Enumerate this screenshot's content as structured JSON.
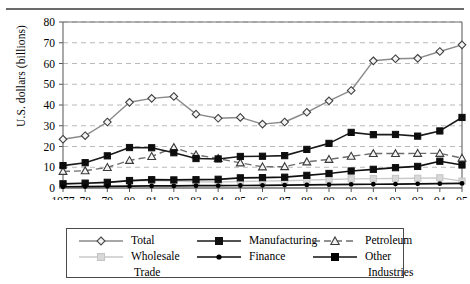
{
  "chart_data": {
    "type": "line",
    "title": "",
    "xlabel": "",
    "ylabel": "U.S. dollars (billions)",
    "ylim": [
      0,
      80
    ],
    "ytick_values": [
      0,
      10,
      20,
      30,
      40,
      50,
      60,
      70,
      80
    ],
    "ytick_labels": [
      "0",
      "10",
      "20",
      "30",
      "40",
      "50",
      "60",
      "70",
      "80"
    ],
    "grid": true,
    "grid_axis": "y",
    "legend_position": "bottom",
    "categories": [
      "1977",
      "78",
      "79",
      "80",
      "81",
      "82",
      "83",
      "84",
      "85",
      "86",
      "87",
      "88",
      "89",
      "90",
      "91",
      "92",
      "93",
      "94",
      "95"
    ],
    "x": [
      1977,
      1978,
      1979,
      1980,
      1981,
      1982,
      1983,
      1984,
      1985,
      1986,
      1987,
      1988,
      1989,
      1990,
      1991,
      1992,
      1993,
      1994,
      1995
    ],
    "series": [
      {
        "name": "Total",
        "marker": "diamond",
        "color": "#8a8a8a",
        "values": [
          23.5,
          25.2,
          31.8,
          41.3,
          43.2,
          44.1,
          35.6,
          33.6,
          34.0,
          30.8,
          31.8,
          36.5,
          42.0,
          47.0,
          61.3,
          62.3,
          62.5,
          65.8,
          69.0
        ]
      },
      {
        "name": "Manufacturing",
        "marker": "square",
        "color": "#1a1a1a",
        "values": [
          10.8,
          12.2,
          15.5,
          19.5,
          19.4,
          17.0,
          14.2,
          14.0,
          15.2,
          15.3,
          15.6,
          18.6,
          21.5,
          26.8,
          25.7,
          25.8,
          25.0,
          27.5,
          34.0
        ]
      },
      {
        "name": "Petroleum",
        "marker": "triangle",
        "color": "#6e6e6e",
        "values": [
          8.0,
          8.3,
          9.9,
          13.3,
          15.2,
          19.5,
          16.0,
          14.2,
          12.1,
          10.2,
          10.3,
          12.6,
          13.8,
          15.3,
          16.6,
          16.6,
          16.7,
          16.7,
          14.4
        ]
      },
      {
        "name": "Wholesale Trade",
        "marker": "square",
        "color": "#c9c9c9",
        "values": [
          2.1,
          2.4,
          2.8,
          3.3,
          3.6,
          3.3,
          3.0,
          2.9,
          3.1,
          3.3,
          3.5,
          3.8,
          4.1,
          4.4,
          4.5,
          4.6,
          4.7,
          4.9,
          3.3
        ]
      },
      {
        "name": "Finance",
        "marker": "dot",
        "color": "#0d0d0d",
        "values": [
          0.6,
          0.7,
          0.8,
          0.9,
          1.0,
          1.0,
          1.1,
          1.1,
          1.2,
          1.3,
          1.4,
          1.5,
          1.6,
          1.7,
          1.8,
          1.9,
          2.0,
          2.1,
          2.2
        ]
      },
      {
        "name": "Other Industries",
        "marker": "square",
        "color": "#111111",
        "values": [
          2.0,
          2.3,
          2.7,
          3.6,
          4.0,
          3.9,
          4.0,
          4.2,
          4.9,
          5.0,
          5.2,
          6.1,
          7.0,
          8.2,
          9.0,
          9.8,
          10.4,
          12.9,
          11.1
        ]
      }
    ]
  },
  "legend": {
    "entries": [
      {
        "label": "Total"
      },
      {
        "label": "Manufacturing"
      },
      {
        "label": "Petroleum"
      },
      {
        "label": "Wholesale"
      },
      {
        "label": "Finance"
      },
      {
        "label": "Other"
      }
    ],
    "wholesale_cont": "Trade",
    "other_cont": "Industries"
  }
}
